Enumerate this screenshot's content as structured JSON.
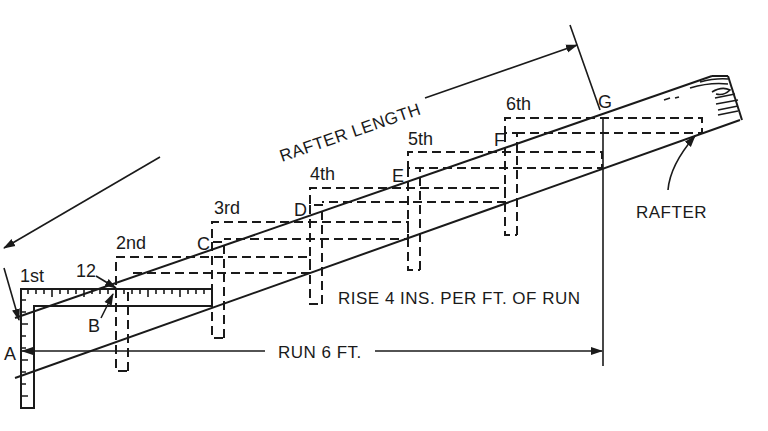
{
  "diagram": {
    "labels": {
      "rafter_length": "RAFTER LENGTH",
      "rafter": "RAFTER",
      "rise": "RISE 4 INS. PER FT. OF RUN",
      "run": "RUN 6 FT.",
      "twelve": "12"
    },
    "points": [
      {
        "id": "A",
        "label": "A"
      },
      {
        "id": "B",
        "label": "B"
      },
      {
        "id": "C",
        "label": "C"
      },
      {
        "id": "D",
        "label": "D"
      },
      {
        "id": "E",
        "label": "E"
      },
      {
        "id": "F",
        "label": "F"
      },
      {
        "id": "G",
        "label": "G"
      }
    ],
    "steps": [
      {
        "label": "1st"
      },
      {
        "label": "2nd"
      },
      {
        "label": "3rd"
      },
      {
        "label": "4th"
      },
      {
        "label": "5th"
      },
      {
        "label": "6th"
      }
    ],
    "colors": {
      "ink": "#1a1a1a",
      "paper": "#ffffff"
    }
  }
}
